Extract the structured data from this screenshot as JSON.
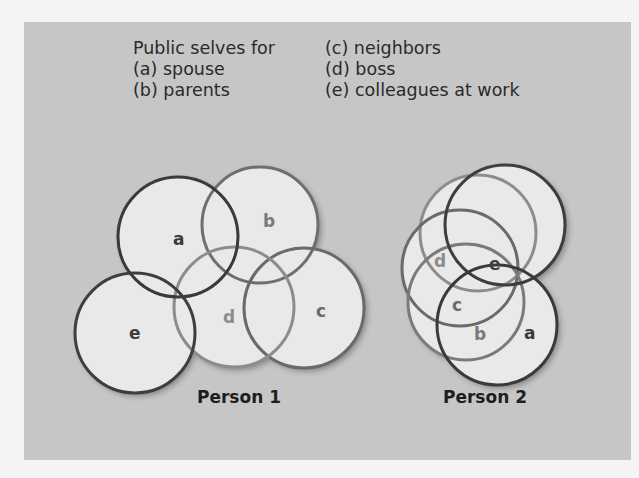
{
  "legend": {
    "title": "Public selves for",
    "items": [
      {
        "key": "(a)",
        "label": "spouse",
        "text": "(a) spouse"
      },
      {
        "key": "(b)",
        "label": "parents",
        "text": "(b) parents"
      },
      {
        "key": "(c)",
        "label": "neighbors",
        "text": "(c) neighbors"
      },
      {
        "key": "(d)",
        "label": "boss",
        "text": "(d) boss"
      },
      {
        "key": "(e)",
        "label": "colleagues at work",
        "text": "(e) colleagues at work"
      }
    ]
  },
  "person1": {
    "caption": "Person 1",
    "circles": [
      {
        "id": "a",
        "label": "a"
      },
      {
        "id": "b",
        "label": "b"
      },
      {
        "id": "c",
        "label": "c"
      },
      {
        "id": "d",
        "label": "d"
      },
      {
        "id": "e",
        "label": "e"
      }
    ]
  },
  "person2": {
    "caption": "Person 2",
    "circles": [
      {
        "id": "a",
        "label": "a"
      },
      {
        "id": "b",
        "label": "b"
      },
      {
        "id": "c",
        "label": "c"
      },
      {
        "id": "d",
        "label": "d"
      },
      {
        "id": "e",
        "label": "e"
      }
    ]
  },
  "colors": {
    "panel_bg": "#c6c6c6",
    "circle_fill": "#e9e9e9",
    "dark_stroke": "#3a3a3a",
    "mid_stroke": "#6e6e6e",
    "light_stroke": "#8c8c8c"
  }
}
